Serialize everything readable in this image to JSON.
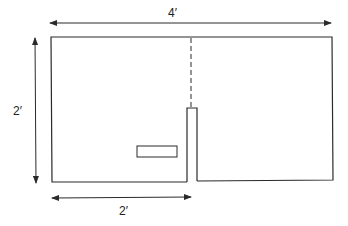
{
  "diagram": {
    "width_label": "4′",
    "height_label": "2′",
    "partial_width_label": "2′",
    "colors": {
      "line": "#2a2a2a",
      "background": "#ffffff"
    }
  }
}
